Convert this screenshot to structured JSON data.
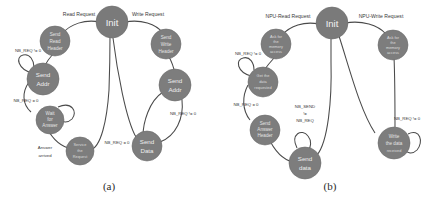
{
  "figure": {
    "background_color": "#ffffff",
    "node_fill": "#7d7d7d",
    "node_text_color": "#efefef",
    "edge_color": "#4a4a4a",
    "label_color": "#3a3a3a"
  },
  "panel_a": {
    "caption": "(a)",
    "nodes": {
      "init": "Init",
      "send_read_header": "Send Read Header",
      "send_read_header_lines": [
        "Send",
        "Read",
        "Header"
      ],
      "send_addr_left": "Send Addr",
      "send_addr_left_lines": [
        "Send",
        "Addr"
      ],
      "wait_for_answer": "Wait for Answer",
      "wait_for_answer_lines": [
        "Wait",
        "for",
        "Answer"
      ],
      "service_the_request": "Service the Request",
      "service_the_request_lines": [
        "Service",
        "the",
        "Request"
      ],
      "send_write_header": "Send Write Header",
      "send_write_header_lines": [
        "Send",
        "Write",
        "Header"
      ],
      "send_addr_right": "Send Addr",
      "send_addr_right_lines": [
        "Send",
        "Addr"
      ],
      "send_data": "Send Data",
      "send_data_lines": [
        "Send",
        "Data"
      ]
    },
    "edge_labels": {
      "read_request": "Read Request",
      "write_request": "Write Request",
      "nb_req_ne_zero_left": "NB_REQ != 0",
      "nb_req_eq_zero_left": "NB_REQ = 0",
      "answer_arrived": "Answer arrived",
      "answer_arrived_lines": [
        "Answer",
        "arrived"
      ],
      "nb_req_eq_zero_center": "NB_REQ = 0",
      "nb_req_ne_zero_right": "NB_REQ != 0"
    }
  },
  "panel_b": {
    "caption": "(b)",
    "nodes": {
      "init": "Init",
      "ask_memory_access_left": "Ask for the memory access",
      "ask_memory_access_left_lines": [
        "Ask for",
        "the",
        "memory",
        "access"
      ],
      "get_data_requested": "Get the data requested",
      "get_data_requested_lines": [
        "Get the",
        "data",
        "requested"
      ],
      "send_answer_header": "Send Answer Header",
      "send_answer_header_lines": [
        "Send",
        "Answer",
        "Header"
      ],
      "send_data": "Send data",
      "send_data_lines": [
        "Send",
        "data"
      ],
      "ask_memory_access_right": "Ask for the memory access",
      "ask_memory_access_right_lines": [
        "Ask for",
        "the",
        "memory",
        "access"
      ],
      "write_data_received": "Write the data received",
      "write_data_received_lines": [
        "Write",
        "the data",
        "received"
      ]
    },
    "edge_labels": {
      "npu_read_request": "NPU-Read Request",
      "npu_write_request": "NPU-Write Request",
      "nb_req_ne_zero_left": "NB_REQ != 0",
      "nb_req_eq_zero_left": "NB_REQ = 0",
      "nb_send_ne_nb_req": "NB_SEND != NB_REQ",
      "nb_send_ne_nb_req_lines": [
        "NB_SEND",
        "!=",
        "NB_REQ"
      ],
      "nb_req_ne_zero_right": "NB_REQ != 0"
    }
  }
}
